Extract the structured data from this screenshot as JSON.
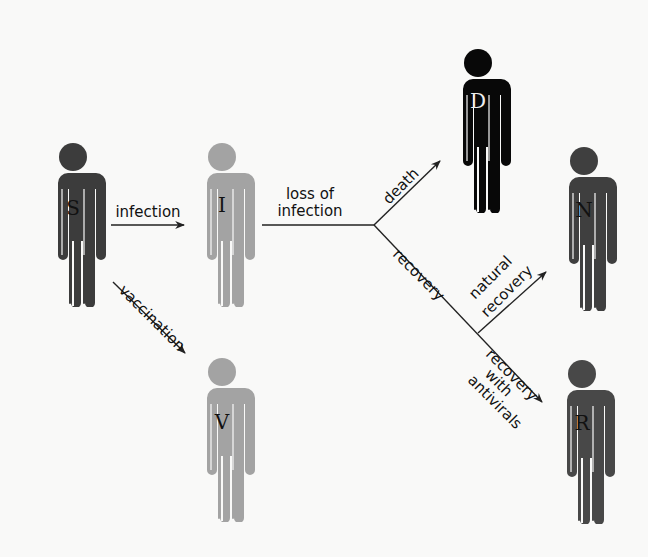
{
  "colors": {
    "S": "#3c3c3c",
    "I": "#a3a3a3",
    "V": "#a3a3a3",
    "D": "#080808",
    "N": "#3f3f3f",
    "R": "#484848",
    "background": "#f9f9f8",
    "line": "#222222"
  },
  "nodes": [
    {
      "id": "S",
      "label": "S",
      "cx": 73,
      "top": 143,
      "scale": 1.0
    },
    {
      "id": "I",
      "label": "I",
      "cx": 222,
      "top": 143,
      "scale": 1.0
    },
    {
      "id": "V",
      "label": "V",
      "cx": 222,
      "top": 358,
      "scale": 1.0
    },
    {
      "id": "D",
      "label": "D",
      "cx": 478,
      "top": 49,
      "scale": 1.0
    },
    {
      "id": "N",
      "label": "N",
      "cx": 584,
      "top": 147,
      "scale": 1.0
    },
    {
      "id": "R",
      "label": "R",
      "cx": 582,
      "top": 360,
      "scale": 1.0
    }
  ],
  "edges": [
    {
      "from": "S",
      "to": "I",
      "label": "infection"
    },
    {
      "from": "S",
      "to": "V",
      "label": "vaccination"
    },
    {
      "from": "I",
      "to": "branch",
      "label": "loss of infection"
    },
    {
      "from": "branch",
      "to": "D",
      "label": "death"
    },
    {
      "from": "branch",
      "to": "recovery-split",
      "label": "recovery"
    },
    {
      "from": "recovery-split",
      "to": "N",
      "label": "natural recovery"
    },
    {
      "from": "recovery-split",
      "to": "R",
      "label": "recovery with antivirals"
    }
  ],
  "labels": {
    "infection": "infection",
    "vaccination": "vaccination",
    "loss_of_line1": "loss of",
    "loss_of_line2": "infection",
    "death": "death",
    "recovery": "recovery",
    "natural_line1": "natural",
    "natural_line2": "recovery",
    "antivirals_line1": "recovery",
    "antivirals_line2": "with",
    "antivirals_line3": "antivirals"
  }
}
